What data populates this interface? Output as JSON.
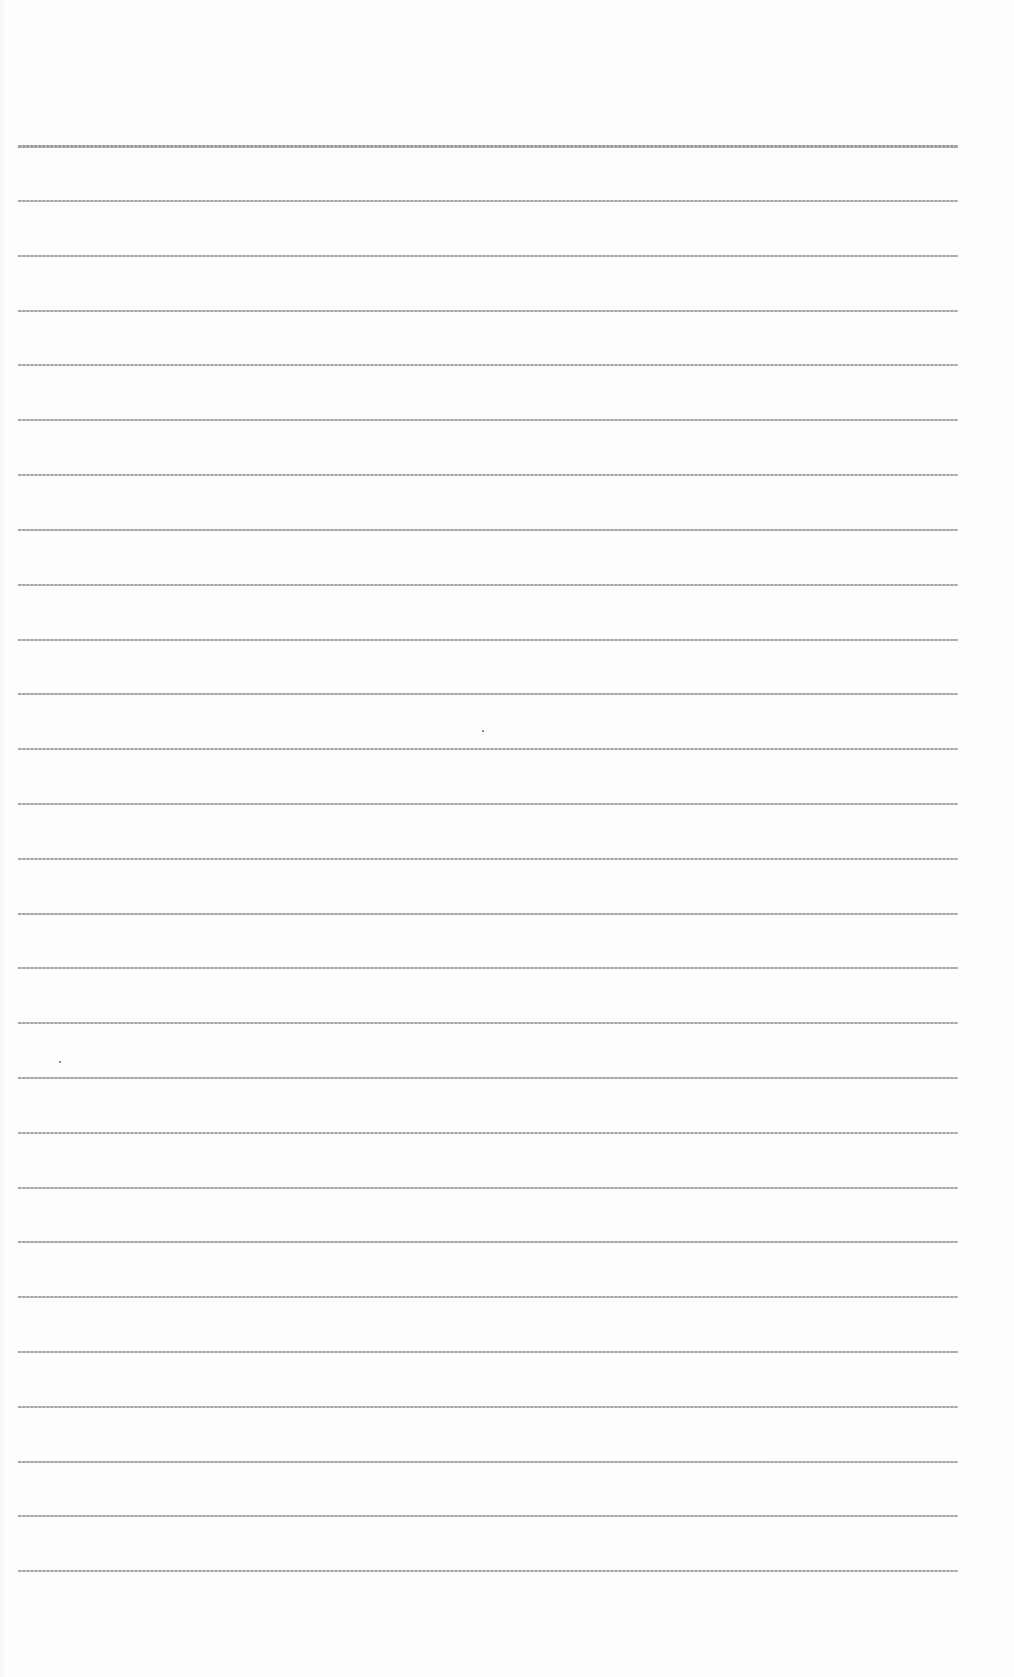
{
  "document": {
    "type": "blank ruled paper",
    "background_color": "#fefefe",
    "rule_color": "#a0a0a0",
    "rule_count": 27,
    "rule_x_start": 18,
    "rule_x_end": 958,
    "rule_first_y": 146,
    "rule_last_y": 1571,
    "rule_y_positions": [
      146,
      201,
      256,
      311,
      365,
      420,
      475,
      530,
      585,
      640,
      694,
      749,
      804,
      859,
      914,
      968,
      1023,
      1078,
      1133,
      1188,
      1242,
      1297,
      1352,
      1407,
      1462,
      1516,
      1571
    ],
    "specks": [
      {
        "x": 482,
        "y": 730
      },
      {
        "x": 59,
        "y": 1061
      }
    ]
  }
}
